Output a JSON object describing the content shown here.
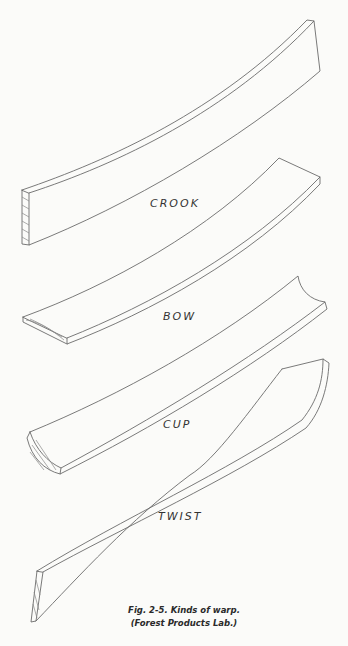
{
  "figure": {
    "labels": {
      "crook": "CROOK",
      "bow": "BOW",
      "cup": "CUP",
      "twist": "TWIST"
    },
    "caption": {
      "line1": "Fig. 2-5. Kinds of warp.",
      "line2": "(Forest Products Lab.)"
    }
  }
}
